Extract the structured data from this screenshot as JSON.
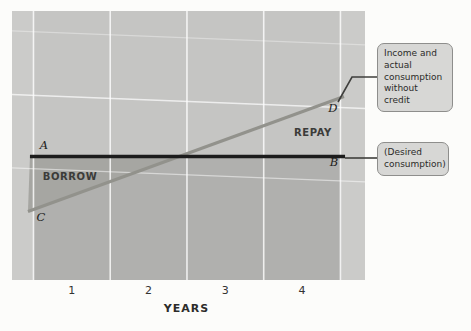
{
  "figure": {
    "canvas_width": 471,
    "canvas_height": 331,
    "background": "#fcfcfa"
  },
  "plot": {
    "rect": {
      "left": 12,
      "top": 11,
      "width": 353,
      "height": 269
    },
    "colors": {
      "base": "#cbcbc9",
      "active_band": "#c5c5c3",
      "below_desired": "#b0b0ae",
      "borrow_triangle": "#a6a6a2",
      "gridline": "#ffffff",
      "connector": "#3f3f3d"
    }
  },
  "chart_data": {
    "type": "line",
    "title": "",
    "xlabel": "YEARS",
    "ylabel": "",
    "xlim": [
      0.22,
      4.82
    ],
    "ylim": [
      0,
      220
    ],
    "x_ticks": [
      1,
      2,
      3,
      4
    ],
    "gridlines_x": [
      0.5,
      1.5,
      2.5,
      3.5,
      4.5
    ],
    "gridlines_y": [
      198,
      146,
      86
    ],
    "grid": "on",
    "legend_position": "callouts-right",
    "series": [
      {
        "id": "income",
        "name": "Income and actual consumption without credit",
        "points": [
          [
            0.428,
            56
          ],
          [
            4.546,
            150
          ]
        ],
        "color": "#92928c",
        "width": 3.2
      },
      {
        "id": "desired",
        "name": "Desired consumption",
        "points": [
          [
            0.454,
            101
          ],
          [
            4.56,
            101
          ]
        ],
        "color": "#1c1c1c",
        "width": 3.4
      }
    ],
    "crossing_point": {
      "x": 2.4,
      "y": 101
    },
    "regions": [
      {
        "id": "borrow-triangle",
        "name": "BORROW area between desired consumption and income before crossing",
        "points": [
          [
            0.454,
            101
          ],
          [
            2.4,
            101
          ],
          [
            0.428,
            56
          ]
        ]
      }
    ],
    "point_labels": [
      {
        "text": "A",
        "x": 0.637,
        "y": 110
      },
      {
        "text": "B",
        "x": 4.416,
        "y": 96
      },
      {
        "text": "C",
        "x": 0.598,
        "y": 51
      },
      {
        "text": "D",
        "x": 4.403,
        "y": 140
      }
    ],
    "region_labels": [
      {
        "text": "BORROW",
        "x": 0.976,
        "y": 84
      },
      {
        "text": "REPAY",
        "x": 4.142,
        "y": 120
      }
    ]
  },
  "callouts": [
    {
      "id": "income",
      "text": "Income and\nactual\nconsumption\nwithout credit",
      "box": {
        "left": 377,
        "top": 43,
        "width": 76
      }
    },
    {
      "id": "desired",
      "text": "(Desired\nconsumption)",
      "box": {
        "left": 377,
        "top": 142,
        "width": 72
      }
    }
  ],
  "connectors": [
    {
      "id": "income",
      "points": [
        [
          338,
          102
        ],
        [
          352,
          77
        ],
        [
          377,
          77
        ]
      ]
    },
    {
      "id": "desired",
      "points": [
        [
          345,
          158
        ],
        [
          377,
          158
        ]
      ]
    }
  ]
}
